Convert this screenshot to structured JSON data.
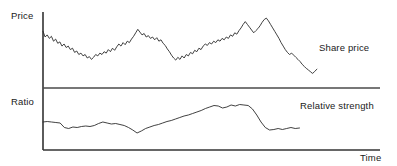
{
  "chart_data": {
    "type": "line",
    "title": "",
    "subtitle": "",
    "xlabel": "Time",
    "ylabel": "",
    "grid": false,
    "legend_position": "inline-right",
    "panels": [
      {
        "name": "price-panel",
        "axis_label": "Price",
        "series_label": "Share price",
        "xlim": [
          0,
          100
        ],
        "ylim": [
          0,
          100
        ],
        "tick_labels_x": [],
        "tick_labels_y": [],
        "series": [
          {
            "name": "Share price",
            "color": "#2b2b2b",
            "x": [
              0,
              0.7,
              1.4,
              2.1,
              2.8,
              3.5,
              4.2,
              4.9,
              5.6,
              6.3,
              7.0,
              7.7,
              8.4,
              9.1,
              9.8,
              10.5,
              11.2,
              11.9,
              12.6,
              13.3,
              14.0,
              14.7,
              15.4,
              16.1,
              16.8,
              17.5,
              18.2,
              18.9,
              19.6,
              20.3,
              21.0,
              21.7,
              22.4,
              23.1,
              23.8,
              24.5,
              25.2,
              25.9,
              26.6,
              27.3,
              28.0,
              28.7,
              29.4,
              30.1,
              30.8,
              31.5,
              32.2,
              32.9,
              33.6,
              34.3,
              35.0,
              35.7,
              36.4,
              37.1,
              37.8,
              38.5,
              39.2,
              39.9,
              40.6,
              41.3,
              42.0,
              42.7,
              43.4,
              44.1,
              44.8,
              45.5,
              46.2,
              46.9,
              47.6,
              48.3,
              49.0,
              49.7,
              50.4,
              51.1,
              51.8,
              52.5,
              53.2,
              53.9,
              54.6,
              55.3,
              56.0,
              56.7,
              57.4,
              58.1,
              58.8,
              59.5,
              60.2,
              60.9,
              61.6,
              62.3,
              63.0,
              63.7,
              64.4,
              65.1,
              65.8,
              66.5,
              67.2,
              67.9,
              68.6,
              69.3,
              70.0,
              70.7,
              71.4,
              72.1,
              72.8,
              73.5,
              74.2,
              74.9,
              75.6,
              76.3,
              77.0,
              77.7,
              78.4,
              79.1,
              79.8,
              80.5,
              81.2,
              81.9,
              82.6,
              83.3,
              84.0,
              84.7,
              85.4,
              86.1,
              86.8,
              87.5,
              88.2,
              88.9,
              89.6,
              90.3,
              91.0
            ],
            "y": [
              78,
              70,
              73,
              68,
              71,
              64,
              67,
              61,
              63,
              57,
              60,
              55,
              57,
              52,
              54,
              48,
              50,
              45,
              47,
              43,
              45,
              40,
              42,
              38,
              41,
              45,
              43,
              47,
              45,
              49,
              47,
              52,
              49,
              54,
              51,
              56,
              60,
              57,
              62,
              59,
              64,
              62,
              67,
              71,
              76,
              81,
              77,
              73,
              75,
              70,
              72,
              68,
              70,
              66,
              69,
              64,
              66,
              61,
              58,
              53,
              49,
              44,
              40,
              37,
              41,
              38,
              43,
              40,
              45,
              43,
              48,
              46,
              51,
              49,
              54,
              52,
              57,
              60,
              58,
              62,
              60,
              64,
              62,
              66,
              64,
              68,
              66,
              70,
              68,
              73,
              71,
              76,
              74,
              79,
              83,
              88,
              92,
              88,
              84,
              80,
              76,
              79,
              82,
              86,
              91,
              95,
              97,
              93,
              88,
              83,
              78,
              73,
              68,
              62,
              57,
              52,
              48,
              45,
              47,
              44,
              41,
              38,
              35,
              31,
              28,
              25,
              23,
              20,
              18,
              21,
              24
            ]
          }
        ]
      },
      {
        "name": "ratio-panel",
        "axis_label": "Ratio",
        "series_label": "Relative strength",
        "xlim": [
          0,
          100
        ],
        "ylim": [
          0,
          100
        ],
        "tick_labels_x": [],
        "tick_labels_y": [],
        "series": [
          {
            "name": "Relative strength",
            "color": "#2b2b2b",
            "x": [
              0,
              1.5,
              3.0,
              4.5,
              6.0,
              7.5,
              9.0,
              10.5,
              12.0,
              13.5,
              15.0,
              16.5,
              18.0,
              19.5,
              21.0,
              22.5,
              24.0,
              25.5,
              27.0,
              28.5,
              30.0,
              31.5,
              33.0,
              34.5,
              36.0,
              37.5,
              39.0,
              40.5,
              42.0,
              43.5,
              45.0,
              46.5,
              48.0,
              49.5,
              51.0,
              52.5,
              54.0,
              55.5,
              57.0,
              58.5,
              60.0,
              61.5,
              63.0,
              64.5,
              66.0,
              67.5,
              69.0,
              70.5,
              72.0,
              73.5,
              75.0,
              76.5,
              78.0,
              79.5,
              81.0,
              82.5,
              84.0,
              85.5,
              87.0,
              88.5,
              90.0
            ],
            "y": [
              44,
              45,
              44,
              43,
              42,
              33,
              31,
              34,
              33,
              35,
              36,
              35,
              37,
              41,
              44,
              42,
              40,
              41,
              39,
              37,
              33,
              28,
              22,
              26,
              31,
              34,
              37,
              39,
              42,
              45,
              47,
              50,
              53,
              56,
              58,
              61,
              64,
              67,
              71,
              74,
              77,
              76,
              72,
              74,
              78,
              76,
              79,
              78,
              77,
              70,
              58,
              44,
              33,
              28,
              29,
              31,
              29,
              31,
              33,
              31,
              32
            ]
          }
        ]
      }
    ]
  },
  "labels": {
    "price": "Price",
    "ratio": "Ratio",
    "time": "Time",
    "share_price": "Share price",
    "relative_strength": "Relative strength"
  },
  "colors": {
    "line": "#2b2b2b",
    "axis": "#333333",
    "background": "#ffffff",
    "text": "#1a1a1a"
  }
}
